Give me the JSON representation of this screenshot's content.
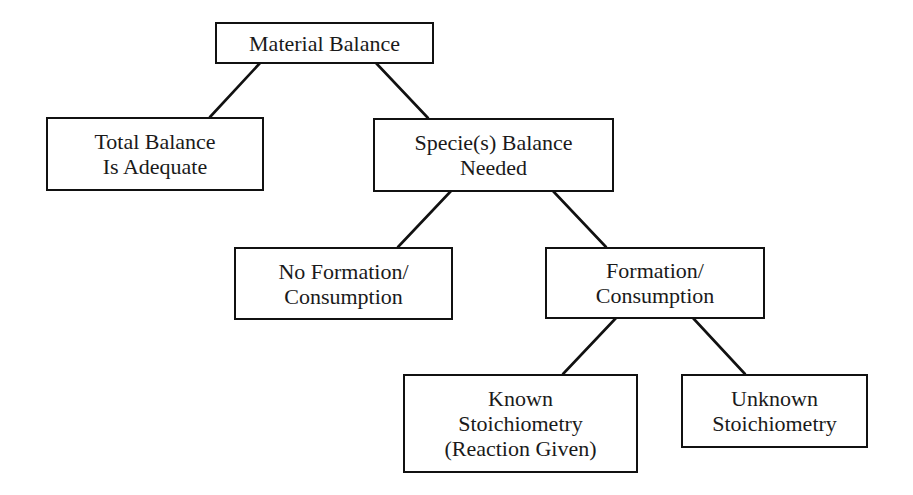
{
  "diagram": {
    "type": "tree",
    "nodes": [
      {
        "id": "material-balance",
        "lines": [
          "Material Balance"
        ]
      },
      {
        "id": "total-balance",
        "lines": [
          "Total Balance",
          "Is Adequate"
        ]
      },
      {
        "id": "species-balance",
        "lines": [
          "Specie(s) Balance",
          "Needed"
        ]
      },
      {
        "id": "no-formation",
        "lines": [
          "No Formation/",
          "Consumption"
        ]
      },
      {
        "id": "formation",
        "lines": [
          "Formation/",
          "Consumption"
        ]
      },
      {
        "id": "known-stoichiometry",
        "lines": [
          "Known",
          "Stoichiometry",
          "(Reaction Given)"
        ]
      },
      {
        "id": "unknown-stoichiometry",
        "lines": [
          "Unknown",
          "Stoichiometry"
        ]
      }
    ],
    "edges": [
      {
        "from": "material-balance",
        "to": "total-balance"
      },
      {
        "from": "material-balance",
        "to": "species-balance"
      },
      {
        "from": "species-balance",
        "to": "no-formation"
      },
      {
        "from": "species-balance",
        "to": "formation"
      },
      {
        "from": "formation",
        "to": "known-stoichiometry"
      },
      {
        "from": "formation",
        "to": "unknown-stoichiometry"
      }
    ]
  }
}
